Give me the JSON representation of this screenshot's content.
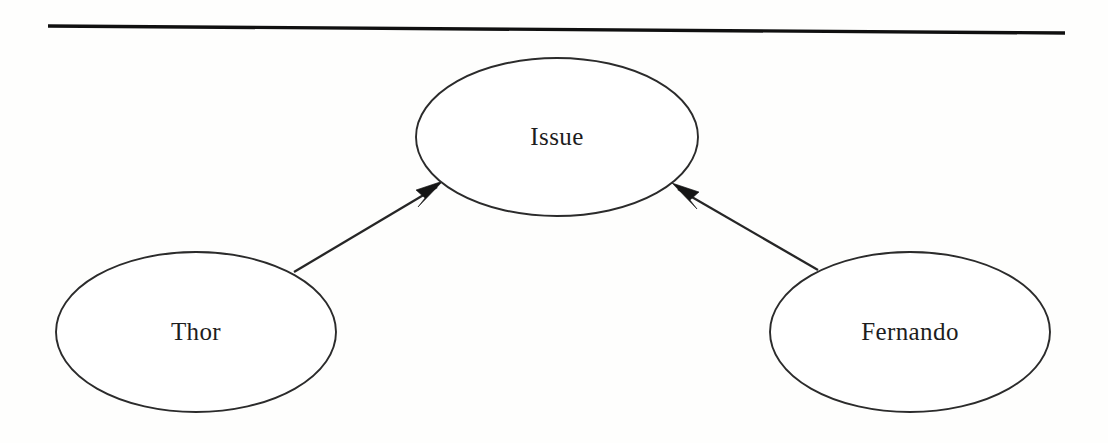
{
  "diagram": {
    "kind": "entity-relationship-graph",
    "background_color": "#fefefd",
    "stroke_color": "#2b2b2b",
    "text_color": "#1d1d1d",
    "top_rule": {
      "name": "horizontal-rule",
      "x1": 48,
      "y1": 26,
      "x2": 1065,
      "y2": 33,
      "thickness": 3.4,
      "color": "#101010"
    },
    "nodes": [
      {
        "id": "issue",
        "label": "Issue",
        "shape": "ellipse",
        "cx": 557,
        "cy": 137,
        "rx": 141,
        "ry": 79,
        "fill": "#ffffff",
        "stroke": "#2b2b2b"
      },
      {
        "id": "thor",
        "label": "Thor",
        "shape": "ellipse",
        "cx": 196,
        "cy": 332,
        "rx": 140,
        "ry": 80,
        "fill": "#ffffff",
        "stroke": "#2b2b2b"
      },
      {
        "id": "fernando",
        "label": "Fernando",
        "shape": "ellipse",
        "cx": 910,
        "cy": 332,
        "rx": 140,
        "ry": 80,
        "fill": "#ffffff",
        "stroke": "#2b2b2b"
      }
    ],
    "edges": [
      {
        "id": "thor-to-issue",
        "from": "thor",
        "to": "issue",
        "label": "",
        "arrow": "single-head",
        "direction": "up-right",
        "x1": 294,
        "y1": 272,
        "x2": 441,
        "y2": 184
      },
      {
        "id": "fernando-to-issue",
        "from": "fernando",
        "to": "issue",
        "label": "",
        "arrow": "single-head",
        "direction": "up-left",
        "x1": 818,
        "y1": 270,
        "x2": 674,
        "y2": 186
      }
    ]
  }
}
